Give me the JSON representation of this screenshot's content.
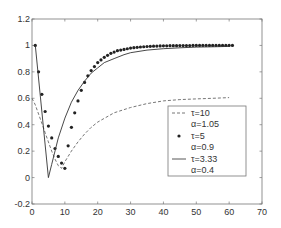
{
  "chart_data": {
    "type": "line",
    "title": "",
    "xlabel": "",
    "ylabel": "",
    "xlim": [
      0,
      70
    ],
    "ylim": [
      -0.2,
      1.2
    ],
    "grid": false,
    "legend_position": "lower right (inside)",
    "x_ticks": [
      "0",
      "10",
      "20",
      "30",
      "40",
      "50",
      "60",
      "70"
    ],
    "y_ticks": [
      "-0.2",
      "0",
      "0.2",
      "0.4",
      "0.6",
      "0.8",
      "1",
      "1.2"
    ],
    "series": [
      {
        "name": "τ=10, α=1.05",
        "style": "dashed",
        "x": [
          0,
          1,
          2,
          3,
          4,
          5,
          6,
          7,
          8,
          9,
          10,
          12,
          14,
          16,
          18,
          20,
          25,
          30,
          35,
          40,
          45,
          50,
          55,
          60
        ],
        "values": [
          0.6,
          0.55,
          0.48,
          0.41,
          0.34,
          0.27,
          0.2,
          0.14,
          0.09,
          0.07,
          0.12,
          0.2,
          0.27,
          0.33,
          0.38,
          0.42,
          0.49,
          0.53,
          0.56,
          0.58,
          0.59,
          0.595,
          0.6,
          0.605
        ]
      },
      {
        "name": "τ=5, α=0.9",
        "style": "markers",
        "x": [
          1,
          2,
          3,
          4,
          5,
          6,
          7,
          8,
          9,
          10,
          11,
          12,
          13,
          14,
          15,
          16,
          17,
          18,
          19,
          20,
          21,
          22,
          23,
          24,
          25,
          26,
          27,
          28,
          29,
          30,
          31,
          32,
          33,
          34,
          35,
          36,
          37,
          38,
          39,
          40,
          41,
          42,
          43,
          44,
          45,
          46,
          47,
          48,
          49,
          50,
          51,
          52,
          53,
          54,
          55,
          56,
          57,
          58,
          59,
          60,
          61
        ],
        "values": [
          1.0,
          0.8,
          0.63,
          0.5,
          0.39,
          0.3,
          0.22,
          0.16,
          0.11,
          0.07,
          0.24,
          0.38,
          0.49,
          0.58,
          0.66,
          0.72,
          0.77,
          0.81,
          0.84,
          0.87,
          0.89,
          0.91,
          0.925,
          0.94,
          0.95,
          0.96,
          0.965,
          0.97,
          0.975,
          0.98,
          0.983,
          0.986,
          0.988,
          0.99,
          0.992,
          0.993,
          0.994,
          0.995,
          0.996,
          0.997,
          0.997,
          0.998,
          0.998,
          0.998,
          0.999,
          0.999,
          0.999,
          0.999,
          1.0,
          1.0,
          1.0,
          1.0,
          1.0,
          1.0,
          1.0,
          1.0,
          1.0,
          1.0,
          1.0,
          1.0,
          1.0
        ]
      },
      {
        "name": "τ=3.33, α=0.4",
        "style": "solid",
        "x": [
          1,
          5,
          6,
          8,
          10,
          12,
          14,
          16,
          18,
          20,
          22,
          25,
          28,
          30,
          35,
          40,
          45,
          50,
          55,
          60
        ],
        "values": [
          1.0,
          0.0,
          0.1,
          0.3,
          0.45,
          0.57,
          0.66,
          0.73,
          0.79,
          0.83,
          0.87,
          0.9,
          0.93,
          0.945,
          0.965,
          0.975,
          0.982,
          0.987,
          0.99,
          0.993
        ]
      }
    ],
    "legend": [
      {
        "line1": "τ=10",
        "line2": "α=1.05",
        "style": "dashed"
      },
      {
        "line1": "τ=5",
        "line2": "α=0.9",
        "style": "markers"
      },
      {
        "line1": "τ=3.33",
        "line2": "α=0.4",
        "style": "solid"
      }
    ]
  }
}
